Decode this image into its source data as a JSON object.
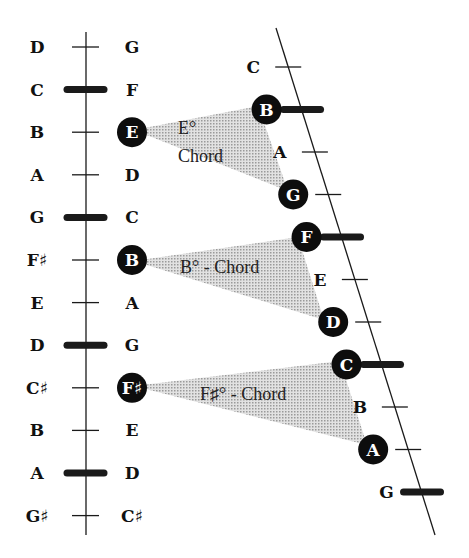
{
  "diagram": {
    "left_column": {
      "notes": [
        "D",
        "C",
        "B",
        "A",
        "G",
        "F♯",
        "E",
        "D",
        "C♯",
        "B",
        "A",
        "G♯"
      ],
      "thick_marks": [
        1,
        4,
        7,
        10
      ]
    },
    "right_column": {
      "notes": [
        "G",
        "F",
        "E",
        "D",
        "C",
        "B",
        "A",
        "G",
        "F♯",
        "E",
        "D",
        "C♯"
      ],
      "circled": [
        2,
        5,
        8
      ]
    },
    "slanted_column": {
      "notes": [
        {
          "label": "C",
          "circled": false,
          "thick": false
        },
        {
          "label": "B",
          "circled": true,
          "thick": true
        },
        {
          "label": "A",
          "circled": false,
          "thick": false
        },
        {
          "label": "G",
          "circled": true,
          "thick": false
        },
        {
          "label": "F",
          "circled": true,
          "thick": true
        },
        {
          "label": "E",
          "circled": false,
          "thick": false
        },
        {
          "label": "D",
          "circled": true,
          "thick": false
        },
        {
          "label": "C",
          "circled": true,
          "thick": true
        },
        {
          "label": "B",
          "circled": false,
          "thick": false
        },
        {
          "label": "A",
          "circled": true,
          "thick": false
        },
        {
          "label": "G",
          "circled": false,
          "thick": true
        }
      ]
    },
    "chords": [
      {
        "root": "E",
        "line1": "E°",
        "line2": "Chord",
        "third": "G",
        "fifth": "B"
      },
      {
        "root": "B",
        "label": "B° - Chord",
        "third": "D",
        "fifth": "F"
      },
      {
        "root": "F♯",
        "label": "F♯° - Chord",
        "third": "A",
        "fifth": "C"
      }
    ],
    "colors": {
      "line": "#1a1a1a",
      "circle_fill": "#0d0d0d",
      "triangle_fill": "#c9c9c9"
    }
  }
}
